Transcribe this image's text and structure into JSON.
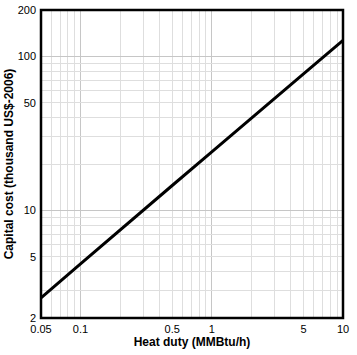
{
  "chart_data": {
    "type": "line",
    "title": "",
    "xlabel": "Heat duty (MMBtu/h)",
    "ylabel": "Capital cost (thousand US$-2006)",
    "x_scale": "log",
    "y_scale": "log",
    "xlim": [
      0.05,
      10
    ],
    "ylim": [
      2,
      200
    ],
    "x_ticks": [
      0.05,
      0.1,
      0.5,
      1,
      5,
      10
    ],
    "x_tick_labels": [
      "0.05",
      "0.1",
      "0.5",
      "1",
      "5",
      "10"
    ],
    "y_ticks": [
      2,
      5,
      10,
      50,
      100,
      200
    ],
    "y_tick_labels": [
      "2",
      "5",
      "10",
      "50",
      "100",
      "200"
    ],
    "grid": "minor log gridlines on, both axes",
    "legend": "none",
    "series": [
      {
        "name": "capital-cost-line",
        "points": [
          [
            0.05,
            2.7
          ],
          [
            0.1,
            4.5
          ],
          [
            0.5,
            14.5
          ],
          [
            1,
            24
          ],
          [
            5,
            77
          ],
          [
            10,
            127
          ]
        ]
      }
    ]
  },
  "colors": {
    "background": "#ffffff",
    "axis_border": "#000000",
    "series_line": "#000000",
    "grid_minor": "#dedede",
    "grid_major": "#c6c6c6",
    "text": "#000000"
  }
}
